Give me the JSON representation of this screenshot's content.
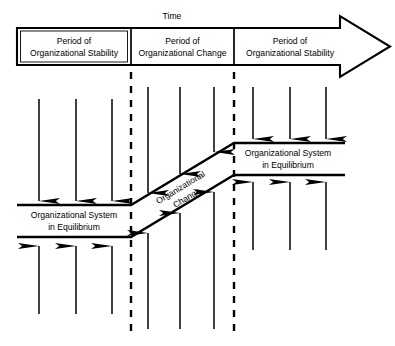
{
  "diagram": {
    "timeline_label": "Time",
    "periods": [
      {
        "line1": "Period of",
        "line2": "Organizational Stability"
      },
      {
        "line1": "Period of",
        "line2": "Organizational Change"
      },
      {
        "line1": "Period of",
        "line2": "Organizational Stability"
      }
    ],
    "bands": {
      "left": {
        "line1": "Organizational System",
        "line2": "in Equilibrium"
      },
      "right": {
        "line1": "Organizational System",
        "line2": "in Equilibrium"
      },
      "diagonal": {
        "line1": "Organizational",
        "line2": "Change"
      }
    },
    "colors": {
      "stroke": "#000000",
      "background": "#ffffff"
    },
    "arrow_groups": {
      "left_down": 3,
      "left_up": 3,
      "middle_down": 3,
      "middle_up": 3,
      "right_down": 3,
      "right_up": 3
    }
  }
}
